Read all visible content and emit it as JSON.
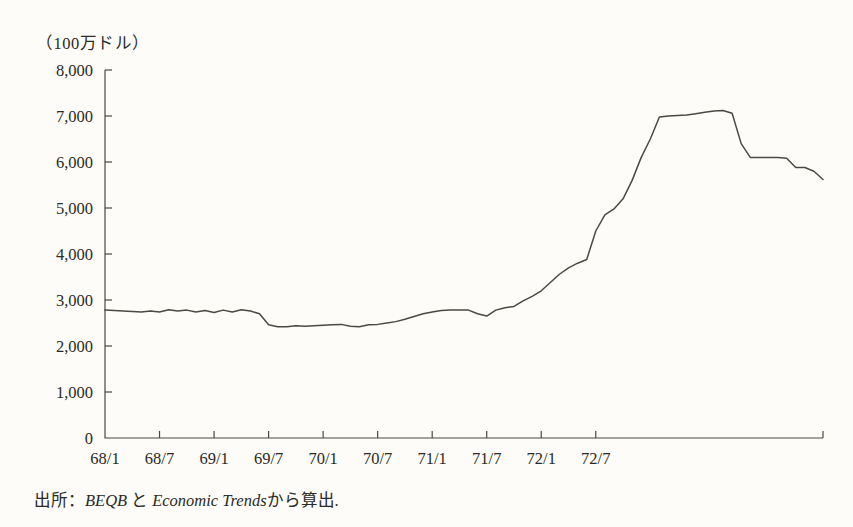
{
  "figure": {
    "unit_label": "（100万ドル）",
    "source_prefix": "出所：",
    "source_journal_1": "BEQB",
    "source_conjunction": "と",
    "source_journal_2": "Economic Trends",
    "source_suffix": "から算出."
  },
  "colors": {
    "line": "#4a4a44",
    "axis": "#4a4a44",
    "text": "#2a2a26",
    "background": "#fdfcf8"
  },
  "chart_data": {
    "type": "line",
    "title": "",
    "subtitle": "",
    "xlabel": "",
    "ylabel": "（100万ドル）",
    "ylim": [
      0,
      8000
    ],
    "yticks": [
      0,
      1000,
      2000,
      3000,
      4000,
      5000,
      6000,
      7000,
      8000
    ],
    "ytick_labels": [
      "0",
      "1,000",
      "2,000",
      "3,000",
      "4,000",
      "5,000",
      "6,000",
      "7,000",
      "8,000"
    ],
    "xtick_labels": [
      "68/1",
      "68/7",
      "69/1",
      "69/7",
      "70/1",
      "70/7",
      "71/1",
      "71/7",
      "72/1",
      "72/7"
    ],
    "xtick_positions": [
      0,
      6,
      12,
      18,
      24,
      30,
      36,
      42,
      48,
      54
    ],
    "x_count": 60,
    "grid": false,
    "legend": null,
    "series": [
      {
        "name": "",
        "values": [
          2780,
          2770,
          2760,
          2750,
          2740,
          2760,
          2740,
          2790,
          2760,
          2780,
          2740,
          2770,
          2730,
          2780,
          2740,
          2790,
          2760,
          2700,
          2460,
          2420,
          2420,
          2440,
          2430,
          2440,
          2450,
          2460,
          2470,
          2430,
          2420,
          2460,
          2470,
          2500,
          2530,
          2580,
          2640,
          2700,
          2740,
          2770,
          2780,
          2780,
          2780,
          2700,
          2650,
          2780,
          2830,
          2860,
          2980,
          3080,
          3200,
          3380,
          3560,
          3700,
          3800,
          3880,
          4500,
          4850,
          4980,
          5200,
          5600,
          6100,
          6500,
          6980,
          7000,
          7010,
          7020,
          7050,
          7080,
          7110,
          7120,
          7060,
          6400,
          6100,
          6100,
          6100,
          6100,
          6080,
          5880,
          5880,
          5800,
          5620
        ]
      }
    ]
  }
}
